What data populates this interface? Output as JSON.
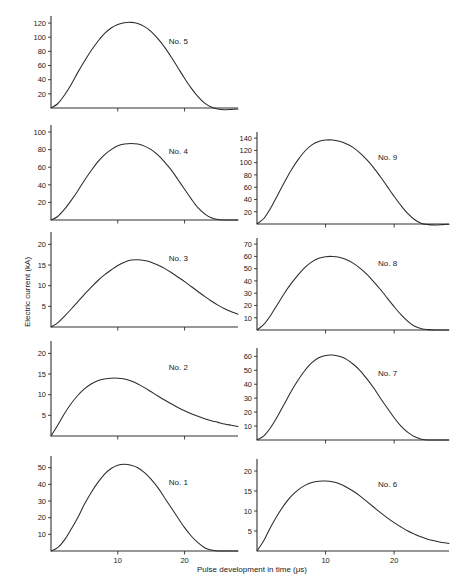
{
  "figure": {
    "xlabel": "Pulse development in time (μs)",
    "ylabel": "Electric current (kA)",
    "axis_color": "#303030",
    "curve_color": "#2b2b2b",
    "background": "#ffffff"
  },
  "chart_data": {
    "type": "line",
    "title": "",
    "xlabel": "Pulse development in time (μs)",
    "ylabel": "Electric current (kA)",
    "xlim": [
      0,
      28
    ],
    "xticks": [
      10,
      20
    ],
    "grid": false,
    "legend": "none",
    "layout": "5 rows x 2 columns of stacked subplots sharing one x axis",
    "panels": [
      {
        "label": "No. 5",
        "column": "left",
        "row": 1,
        "ylim": [
          0,
          130
        ],
        "yticks": [
          20,
          40,
          60,
          80,
          100,
          120
        ],
        "peak_value": 121,
        "peak_time": 12,
        "x": [
          0,
          1,
          2,
          3,
          4,
          5,
          6,
          7,
          8,
          9,
          10,
          11,
          12,
          13,
          14,
          15,
          16,
          17,
          18,
          19,
          20,
          21,
          22,
          23,
          24,
          25,
          26,
          27,
          28
        ],
        "y": [
          0,
          6,
          18,
          33,
          50,
          66,
          81,
          94,
          105,
          113,
          118,
          120.5,
          121,
          119.5,
          115,
          108,
          98,
          86,
          72,
          57,
          42,
          28,
          16,
          7,
          1.5,
          -1.5,
          -2.5,
          -2,
          -1.5
        ]
      },
      {
        "label": "No. 4",
        "column": "left",
        "row": 2,
        "ylim": [
          0,
          108
        ],
        "yticks": [
          20,
          40,
          60,
          80,
          100
        ],
        "peak_value": 87,
        "peak_time": 13,
        "x": [
          0,
          1,
          2,
          3,
          4,
          5,
          6,
          7,
          8,
          9,
          10,
          11,
          12,
          13,
          14,
          15,
          16,
          17,
          18,
          19,
          20,
          21,
          22,
          23,
          24,
          25,
          26,
          27,
          28
        ],
        "y": [
          0,
          4,
          12,
          22,
          33,
          45,
          56,
          66,
          74,
          80,
          84.5,
          86.5,
          87,
          86.5,
          84,
          80,
          74,
          66,
          57,
          46,
          35,
          24,
          14,
          7,
          2.5,
          0.5,
          0,
          0,
          0
        ]
      },
      {
        "label": "No. 3",
        "column": "left",
        "row": 3,
        "ylim": [
          0,
          23
        ],
        "yticks": [
          5,
          10,
          15,
          20
        ],
        "peak_value": 16.3,
        "peak_time": 13,
        "x": [
          0,
          1,
          2,
          3,
          4,
          5,
          6,
          7,
          8,
          9,
          10,
          11,
          12,
          13,
          14,
          15,
          16,
          17,
          18,
          19,
          20,
          21,
          22,
          23,
          24,
          25,
          26,
          27,
          28
        ],
        "y": [
          0,
          1.0,
          2.6,
          4.3,
          6.1,
          7.9,
          9.6,
          11.2,
          12.6,
          13.8,
          14.9,
          15.7,
          16.2,
          16.3,
          16.1,
          15.7,
          15.0,
          14.2,
          13.2,
          12.1,
          11.0,
          9.8,
          8.6,
          7.4,
          6.3,
          5.3,
          4.4,
          3.7,
          3.1
        ]
      },
      {
        "label": "No. 2",
        "column": "left",
        "row": 4,
        "ylim": [
          0,
          23
        ],
        "yticks": [
          5,
          10,
          15,
          20
        ],
        "peak_value": 14,
        "peak_time": 10,
        "x": [
          0,
          1,
          2,
          3,
          4,
          5,
          6,
          7,
          8,
          9,
          10,
          11,
          12,
          13,
          14,
          15,
          16,
          17,
          18,
          19,
          20,
          21,
          22,
          23,
          24,
          25,
          26,
          27,
          28
        ],
        "y": [
          0,
          2.6,
          5.4,
          7.8,
          9.8,
          11.4,
          12.6,
          13.4,
          13.8,
          14.0,
          14.0,
          13.8,
          13.3,
          12.6,
          11.7,
          10.7,
          9.7,
          8.7,
          7.8,
          6.9,
          6.1,
          5.4,
          4.8,
          4.2,
          3.7,
          3.3,
          2.9,
          2.6,
          2.3
        ]
      },
      {
        "label": "No. 1",
        "column": "left",
        "row": 5,
        "ylim": [
          0,
          57
        ],
        "yticks": [
          10,
          20,
          30,
          40,
          50
        ],
        "peak_value": 52,
        "peak_time": 11,
        "x": [
          0,
          1,
          2,
          3,
          4,
          5,
          6,
          7,
          8,
          9,
          10,
          11,
          12,
          13,
          14,
          15,
          16,
          17,
          18,
          19,
          20,
          21,
          22,
          23,
          24,
          25,
          26,
          27,
          28
        ],
        "y": [
          0,
          2,
          6.5,
          13,
          20,
          28,
          35,
          41,
          46,
          49.5,
          51.5,
          52,
          51.5,
          50,
          47,
          43,
          38,
          32,
          26,
          20,
          14,
          9,
          5,
          2,
          0.6,
          0,
          0,
          0,
          0
        ]
      },
      {
        "label": "No. 9",
        "column": "right",
        "row": 1,
        "ylim": [
          0,
          150
        ],
        "yticks": [
          20,
          40,
          60,
          80,
          100,
          120,
          140
        ],
        "peak_value": 137,
        "peak_time": 11,
        "x": [
          0,
          1,
          2,
          3,
          4,
          5,
          6,
          7,
          8,
          9,
          10,
          11,
          12,
          13,
          14,
          15,
          16,
          17,
          18,
          19,
          20,
          21,
          22,
          23,
          24,
          25,
          26,
          27,
          28
        ],
        "y": [
          0,
          9,
          26,
          47,
          68,
          88,
          105,
          119,
          129,
          134.5,
          136.8,
          137,
          135,
          131,
          125,
          116,
          105,
          92,
          77,
          61,
          45,
          30,
          17,
          7,
          1,
          -1,
          -1.5,
          -1,
          -0.5
        ]
      },
      {
        "label": "No. 8",
        "column": "right",
        "row": 2,
        "ylim": [
          0,
          75
        ],
        "yticks": [
          10,
          20,
          30,
          40,
          50,
          60,
          70
        ],
        "peak_value": 60,
        "peak_time": 10.5,
        "x": [
          0,
          1,
          2,
          3,
          4,
          5,
          6,
          7,
          8,
          9,
          10,
          11,
          12,
          13,
          14,
          15,
          16,
          17,
          18,
          19,
          20,
          21,
          22,
          23,
          24,
          25,
          26,
          27,
          28
        ],
        "y": [
          0,
          4.5,
          12,
          21,
          30,
          38,
          45,
          51,
          55.5,
          58.5,
          59.8,
          60,
          59.3,
          57.5,
          54.5,
          50.5,
          45.5,
          39.5,
          33,
          26,
          19,
          12.5,
          7,
          3,
          1,
          0.3,
          0,
          0,
          0
        ]
      },
      {
        "label": "No. 7",
        "column": "right",
        "row": 3,
        "ylim": [
          0,
          66
        ],
        "yticks": [
          10,
          20,
          30,
          40,
          50,
          60
        ],
        "peak_value": 61,
        "peak_time": 11,
        "x": [
          0,
          1,
          2,
          3,
          4,
          5,
          6,
          7,
          8,
          9,
          10,
          11,
          12,
          13,
          14,
          15,
          16,
          17,
          18,
          19,
          20,
          21,
          22,
          23,
          24,
          25,
          26,
          27,
          28
        ],
        "y": [
          0,
          3,
          9,
          17,
          26,
          35,
          43,
          50,
          55.5,
          59,
          60.7,
          61,
          60,
          58,
          54.5,
          50,
          44,
          37.5,
          30,
          23,
          16,
          10,
          5.5,
          2.3,
          0.6,
          0,
          0,
          0,
          0
        ]
      },
      {
        "label": "No. 6",
        "column": "right",
        "row": 4,
        "ylim": [
          0,
          23
        ],
        "yticks": [
          5,
          10,
          15,
          20
        ],
        "peak_value": 17.5,
        "peak_time": 10,
        "x": [
          0,
          1,
          2,
          3,
          4,
          5,
          6,
          7,
          8,
          9,
          10,
          11,
          12,
          13,
          14,
          15,
          16,
          17,
          18,
          19,
          20,
          21,
          22,
          23,
          24,
          25,
          26,
          27,
          28
        ],
        "y": [
          0,
          2.6,
          6.0,
          9.0,
          11.6,
          13.7,
          15.3,
          16.4,
          17.1,
          17.45,
          17.5,
          17.3,
          16.8,
          16.0,
          15.0,
          13.8,
          12.4,
          11.0,
          9.6,
          8.3,
          7.1,
          6.0,
          5.0,
          4.2,
          3.5,
          2.9,
          2.5,
          2.1,
          1.9
        ]
      }
    ]
  }
}
